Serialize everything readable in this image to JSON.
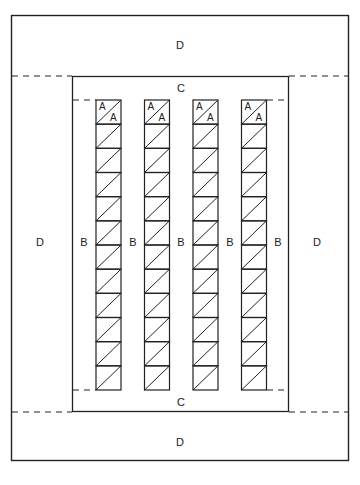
{
  "diagram": {
    "labels": {
      "top_border": "D",
      "bottom_border": "D",
      "left_border": "D",
      "right_border": "D",
      "top_inner_border": "C",
      "bottom_inner_border": "C",
      "sashing": [
        "B",
        "B",
        "B",
        "B",
        "B"
      ],
      "block_top_left": "A",
      "block_bottom_right": "A"
    },
    "layout": {
      "columns": 4,
      "rows_per_column": 12,
      "first_row_labeled": true
    },
    "colors": {
      "line": "#222222",
      "background": "#ffffff"
    }
  }
}
